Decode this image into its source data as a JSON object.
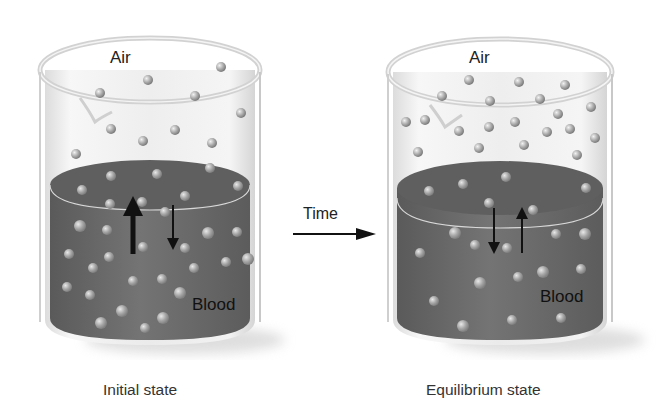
{
  "figure": {
    "transition_label": "Time",
    "colors": {
      "blood": "#6e6e6e",
      "blood_surface": "#5e5e5e",
      "glass": "#e6e6e6",
      "molecule": "#b8b8b8",
      "arrow": "#111111"
    }
  },
  "panels": [
    {
      "caption": "Initial state",
      "top_label": "Air",
      "bottom_label": "Blood",
      "arrows": {
        "up": "thick",
        "down": "thin"
      },
      "air_molecule_count": 11,
      "blood_molecule_count": 36
    },
    {
      "caption": "Equilibrium state",
      "top_label": "Air",
      "bottom_label": "Blood",
      "arrows": {
        "up": "thin",
        "down": "thin"
      },
      "air_molecule_count": 22,
      "blood_molecule_count": 22
    }
  ]
}
